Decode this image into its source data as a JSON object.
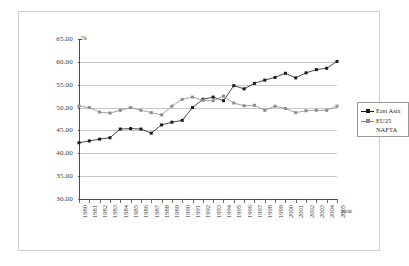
{
  "chart_data": {
    "type": "line",
    "title": "",
    "xlabel": "year",
    "ylabel": "",
    "yunit": "%",
    "ylim": [
      30,
      65
    ],
    "yticks": [
      "30.00",
      "35.00",
      "40.00",
      "45.00",
      "50.00",
      "55.00",
      "60.00",
      "65.00"
    ],
    "grid": true,
    "legend_position": "right",
    "categories": [
      "1980",
      "1981",
      "1982",
      "1983",
      "1984",
      "1985",
      "1986",
      "1987",
      "1988",
      "1989",
      "1990",
      "1991",
      "1992",
      "1993",
      "1994",
      "1995",
      "1996",
      "1997",
      "1998",
      "1999",
      "2000",
      "2001",
      "2002",
      "2003",
      "2004",
      "2005"
    ],
    "series": [
      {
        "name": "East Asia",
        "color": "#1a1a1a",
        "marker": "square",
        "values": [
          42.3,
          42.7,
          43.1,
          43.4,
          45.3,
          45.4,
          45.3,
          44.4,
          46.2,
          46.8,
          47.2,
          50.0,
          51.8,
          52.3,
          51.5,
          54.8,
          54.1,
          55.3,
          56.0,
          56.6,
          57.5,
          56.5,
          57.6,
          58.3,
          58.6,
          60.1
        ]
      },
      {
        "name": "EU25 NAFTA",
        "color": "#8c8c8c",
        "marker": "square",
        "values": [
          50.3,
          50.0,
          49.0,
          48.8,
          49.4,
          50.0,
          49.4,
          48.9,
          48.4,
          50.3,
          51.8,
          52.3,
          51.6,
          51.5,
          52.5,
          51.0,
          50.4,
          50.5,
          49.4,
          50.3,
          49.8,
          48.9,
          49.3,
          49.4,
          49.4,
          50.3
        ]
      }
    ]
  },
  "legend": {
    "entries": [
      {
        "label": "East Asia"
      },
      {
        "label": "EU25"
      }
    ],
    "sublabel": "NAFTA"
  }
}
